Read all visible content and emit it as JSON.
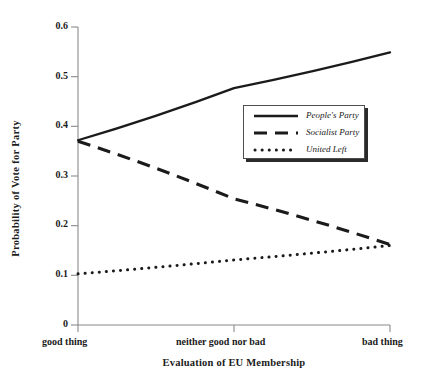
{
  "chart_data": {
    "type": "line",
    "title": "",
    "xlabel": "Evaluation of EU Membership",
    "ylabel": "Probability of Vote for Party",
    "x": [
      0,
      1,
      2
    ],
    "categories": [
      "good thing",
      "neither good nor bad",
      "bad thing"
    ],
    "ylim": [
      0,
      0.6
    ],
    "yticks": [
      0,
      0.1,
      0.2,
      0.3,
      0.4,
      0.5,
      0.6
    ],
    "ytick_labels": [
      "0",
      "0.1",
      "0.2",
      "0.3",
      "0.4",
      "0.5",
      "0.6"
    ],
    "grid": false,
    "legend_position": "center-right-upper",
    "series": [
      {
        "name": "People's Party",
        "style": "solid",
        "color": "#1b1b1b",
        "values": [
          0.372,
          0.477,
          0.549
        ]
      },
      {
        "name": "Socialist Party",
        "style": "dashed",
        "color": "#1b1b1b",
        "values": [
          0.37,
          0.254,
          0.162
        ]
      },
      {
        "name": "United Left",
        "style": "dotted",
        "color": "#1b1b1b",
        "values": [
          0.103,
          0.131,
          0.16
        ]
      }
    ]
  },
  "axes": {
    "y_title": "Probability of Vote for Party",
    "x_title": "Evaluation of EU Membership",
    "y_ticks": [
      {
        "label": "0.6",
        "value": 0.6
      },
      {
        "label": "0.5",
        "value": 0.5
      },
      {
        "label": "0.4",
        "value": 0.4
      },
      {
        "label": "0.3",
        "value": 0.3
      },
      {
        "label": "0.2",
        "value": 0.2
      },
      {
        "label": "0.1",
        "value": 0.1
      },
      {
        "label": "0",
        "value": 0
      }
    ],
    "x_ticks": [
      {
        "label": "good thing"
      },
      {
        "label": "neither good nor bad"
      },
      {
        "label": "bad thing"
      }
    ]
  },
  "legend": {
    "entries": [
      {
        "label": "People's Party",
        "style": "solid"
      },
      {
        "label": "Socialist Party",
        "style": "dashed"
      },
      {
        "label": "United Left",
        "style": "dotted"
      }
    ]
  },
  "colors": {
    "ink": "#1b1b1b",
    "axis": "#8a8a8a",
    "background": "#ffffff",
    "legend_border": "#4d4d4d",
    "legend_shadow": "#2b2b2b"
  }
}
